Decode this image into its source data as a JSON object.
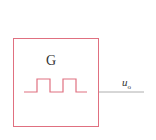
{
  "diagram": {
    "block_label": "G",
    "output_label": "u",
    "output_subscript": "o",
    "colors": {
      "block": "#e07080",
      "wire": "#999999",
      "text": "#333333"
    }
  }
}
